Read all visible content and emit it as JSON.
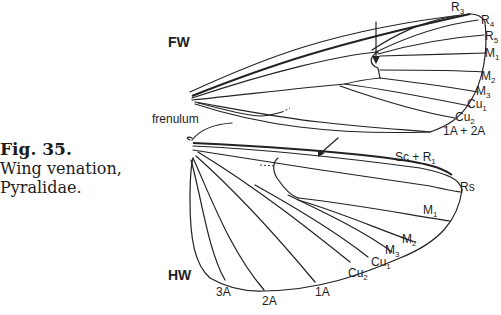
{
  "caption": {
    "figure_number": "Fig. 35.",
    "line1": "Wing venation,",
    "line2": "Pyralidae."
  },
  "forewing": {
    "title": "FW",
    "structure_label": "frenulum",
    "veins": [
      {
        "base": "R",
        "sub": "3"
      },
      {
        "base": "R",
        "sub": "4"
      },
      {
        "base": "R",
        "sub": "5"
      },
      {
        "base": "M",
        "sub": "1"
      },
      {
        "base": "M",
        "sub": "2"
      },
      {
        "base": "M",
        "sub": "3"
      },
      {
        "base": "Cu",
        "sub": "1"
      },
      {
        "base": "Cu",
        "sub": "2"
      },
      {
        "base": "1A + 2A",
        "sub": ""
      }
    ]
  },
  "hindwing": {
    "title": "HW",
    "veins": [
      {
        "base": "Sc + R",
        "sub": "1"
      },
      {
        "base": "Rs",
        "sub": ""
      },
      {
        "base": "M",
        "sub": "1"
      },
      {
        "base": "M",
        "sub": "2"
      },
      {
        "base": "M",
        "sub": "3"
      },
      {
        "base": "Cu",
        "sub": "1"
      },
      {
        "base": "Cu",
        "sub": "2"
      },
      {
        "base": "1A",
        "sub": ""
      },
      {
        "base": "2A",
        "sub": ""
      },
      {
        "base": "3A",
        "sub": ""
      }
    ]
  }
}
